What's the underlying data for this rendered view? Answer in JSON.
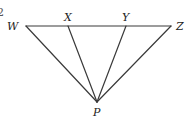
{
  "diagram": {
    "type": "geometry-figure",
    "edge_fragment": "2",
    "points": [
      {
        "id": "W",
        "label": "W",
        "x": 26,
        "y": 26,
        "lx": 7,
        "ly": 30
      },
      {
        "id": "X",
        "label": "X",
        "x": 68,
        "y": 26,
        "lx": 64,
        "ly": 21
      },
      {
        "id": "Y",
        "label": "Y",
        "x": 126,
        "y": 26,
        "lx": 122,
        "ly": 21
      },
      {
        "id": "Z",
        "label": "Z",
        "x": 171,
        "y": 26,
        "lx": 176,
        "ly": 30
      },
      {
        "id": "P",
        "label": "P",
        "x": 97,
        "y": 102,
        "lx": 93,
        "ly": 116
      }
    ],
    "segments": [
      {
        "from": "W",
        "to": "Z"
      },
      {
        "from": "W",
        "to": "P"
      },
      {
        "from": "X",
        "to": "P"
      },
      {
        "from": "Y",
        "to": "P"
      },
      {
        "from": "Z",
        "to": "P"
      }
    ],
    "stroke_color": "#3a3a3a"
  }
}
